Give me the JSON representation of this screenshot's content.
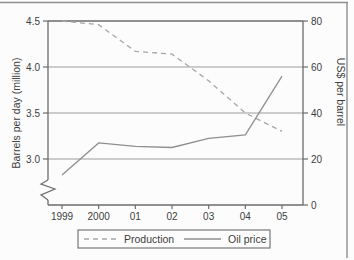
{
  "figure": {
    "background": "#fcfcfc",
    "page_border_color": "#8f8f8f"
  },
  "theme": {
    "axis_color": "#6b6b6b",
    "grid_color": "#9c9c9c",
    "text_color": "#3d3d3d",
    "tick_font_size": 10,
    "label_font_size": 10.5
  },
  "chart_data": {
    "type": "line",
    "categories": [
      "1999",
      "2000",
      "01",
      "02",
      "03",
      "04",
      "05"
    ],
    "series": [
      {
        "name": "Production",
        "axis": "left",
        "style": "dashed",
        "color": "#a6a6a6",
        "values": [
          4.5,
          4.46,
          4.17,
          4.14,
          3.85,
          3.5,
          3.3
        ]
      },
      {
        "name": "Oil price",
        "axis": "right",
        "style": "solid",
        "color": "#8f8f8f",
        "values": [
          13,
          27,
          25.5,
          25,
          29,
          30.5,
          56
        ]
      }
    ],
    "left_axis": {
      "label": "Barrels per day (million)",
      "tick_labels": [
        "4.5",
        "4.0",
        "3.5",
        "3.0"
      ],
      "ticks": [
        4.5,
        4.0,
        3.5,
        3.0
      ],
      "range": [
        3.0,
        4.5
      ],
      "broken_axis": true
    },
    "right_axis": {
      "label": "US$ per barrel",
      "tick_labels": [
        "80",
        "60",
        "40",
        "20",
        "0"
      ],
      "ticks": [
        80,
        60,
        40,
        20,
        0
      ],
      "range": [
        0,
        80
      ]
    },
    "grid": true,
    "legend": {
      "position": "bottom",
      "entries": [
        {
          "label": "Production",
          "line": "dashed"
        },
        {
          "label": "Oil price",
          "line": "solid"
        }
      ]
    }
  }
}
